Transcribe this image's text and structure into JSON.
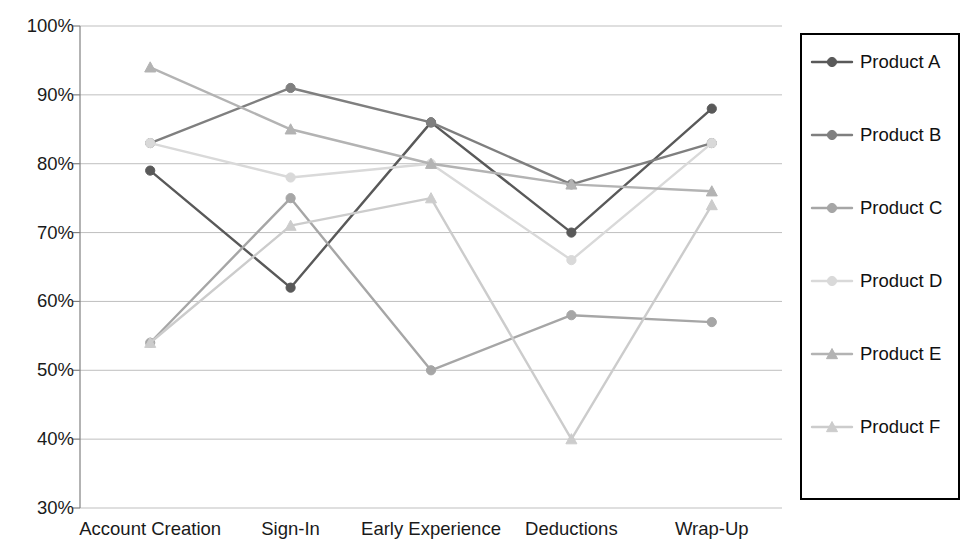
{
  "chart_data": {
    "type": "line",
    "title": "",
    "xlabel": "",
    "ylabel": "",
    "categories": [
      "Account Creation",
      "Sign-In",
      "Early Experience",
      "Deductions",
      "Wrap-Up"
    ],
    "ylim": [
      30,
      100
    ],
    "ytick_labels": [
      "100%",
      "90%",
      "80%",
      "70%",
      "60%",
      "50%",
      "40%",
      "30%"
    ],
    "ytick_values": [
      100,
      90,
      80,
      70,
      60,
      50,
      40,
      30
    ],
    "grid": true,
    "legend_position": "right",
    "series": [
      {
        "name": "Product A",
        "values": [
          79,
          62,
          86,
          70,
          88
        ],
        "color": "#595959",
        "marker": "diamond"
      },
      {
        "name": "Product B",
        "values": [
          83,
          91,
          86,
          77,
          83
        ],
        "color": "#7f7f7f",
        "marker": "diamond"
      },
      {
        "name": "Product C",
        "values": [
          54,
          75,
          50,
          58,
          57
        ],
        "color": "#a6a6a6",
        "marker": "diamond"
      },
      {
        "name": "Product D",
        "values": [
          83,
          78,
          80,
          66,
          83
        ],
        "color": "#d9d9d9",
        "marker": "diamond"
      },
      {
        "name": "Product E",
        "values": [
          94,
          85,
          80,
          77,
          76
        ],
        "color": "#b3b3b3",
        "marker": "triangle"
      },
      {
        "name": "Product F",
        "values": [
          54,
          71,
          75,
          40,
          74
        ],
        "color": "#cccccc",
        "marker": "triangle"
      }
    ]
  },
  "legend": {
    "entries": [
      {
        "label": "Product A"
      },
      {
        "label": "Product B"
      },
      {
        "label": "Product C"
      },
      {
        "label": "Product D"
      },
      {
        "label": "Product E"
      },
      {
        "label": "Product F"
      }
    ]
  },
  "axes": {
    "x_labels": [
      "Account Creation",
      "Sign-In",
      "Early Experience",
      "Deductions",
      "Wrap-Up"
    ],
    "y_labels": [
      "100%",
      "90%",
      "80%",
      "70%",
      "60%",
      "50%",
      "40%",
      "30%"
    ]
  },
  "colors": {
    "axis": "#808080",
    "grid": "#bfbfbf",
    "legend_border": "#000000",
    "background": "#ffffff"
  }
}
